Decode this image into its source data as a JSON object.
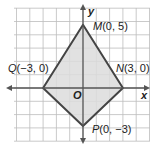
{
  "figure": {
    "axes": {
      "x_label": "x",
      "y_label": "y",
      "origin_label": "O"
    },
    "points": [
      {
        "name": "M",
        "coord": "(0, 5)",
        "x": 0,
        "y": 5
      },
      {
        "name": "N",
        "coord": "(3, 0)",
        "x": 3,
        "y": 0
      },
      {
        "name": "P",
        "coord": "(0, −3)",
        "x": 0,
        "y": -3
      },
      {
        "name": "Q",
        "coord": "(−3, 0)",
        "x": -3,
        "y": 0
      }
    ],
    "colors": {
      "grid": "#b8b8b8",
      "fill": "#dcdcdc",
      "outline": "#444444",
      "axis": "#555555"
    }
  }
}
